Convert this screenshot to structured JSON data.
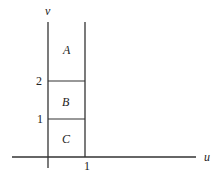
{
  "diagram": {
    "axes": {
      "x_label": "u",
      "y_label": "v",
      "x_ticks": [
        "1"
      ],
      "y_ticks": [
        "1",
        "2"
      ]
    },
    "regions": [
      {
        "label": "A",
        "u_range": [
          0,
          1
        ],
        "v_range": [
          2,
          null
        ]
      },
      {
        "label": "B",
        "u_range": [
          0,
          1
        ],
        "v_range": [
          1,
          2
        ]
      },
      {
        "label": "C",
        "u_range": [
          0,
          1
        ],
        "v_range": [
          0,
          1
        ]
      }
    ],
    "line_color": "#333333"
  }
}
